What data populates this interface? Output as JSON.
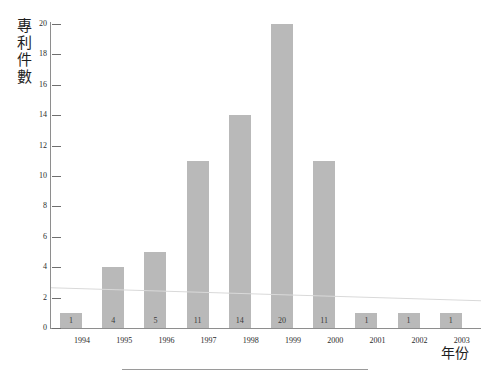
{
  "chart_data": {
    "type": "bar",
    "title": "",
    "subtitle": "",
    "xlabel": "年份",
    "ylabel": "專利件數",
    "categories": [
      "1994",
      "1995",
      "1996",
      "1997",
      "1998",
      "1999",
      "2000",
      "2001",
      "2002",
      "2003"
    ],
    "values": [
      1,
      4,
      5,
      11,
      14,
      20,
      11,
      1,
      1,
      1
    ],
    "data_labels": [
      "1",
      "4",
      "5",
      "11",
      "14",
      "20",
      "11",
      "1",
      "1",
      "1"
    ],
    "ylim": [
      0,
      20
    ],
    "ytick_labels": [
      "0",
      "2",
      "4",
      "6",
      "8",
      "10",
      "12",
      "14",
      "16",
      "18",
      "20"
    ],
    "ytick_values": [
      0,
      2,
      4,
      6,
      8,
      10,
      12,
      14,
      16,
      18,
      20
    ],
    "grid": false,
    "legend": null,
    "legend_position": "none",
    "series": [
      {
        "name": "專利件數",
        "values": [
          1,
          4,
          5,
          11,
          14,
          20,
          11,
          1,
          1,
          1
        ]
      }
    ],
    "colors": {
      "bar_fill": "#b9b9b9",
      "axis": "#8e8e8e",
      "text": "#2b2b2b",
      "background": "#ffffff",
      "rule": "#9a9a9a"
    }
  },
  "y_axis_title_chars": [
    "專",
    "利",
    "件",
    "數"
  ]
}
